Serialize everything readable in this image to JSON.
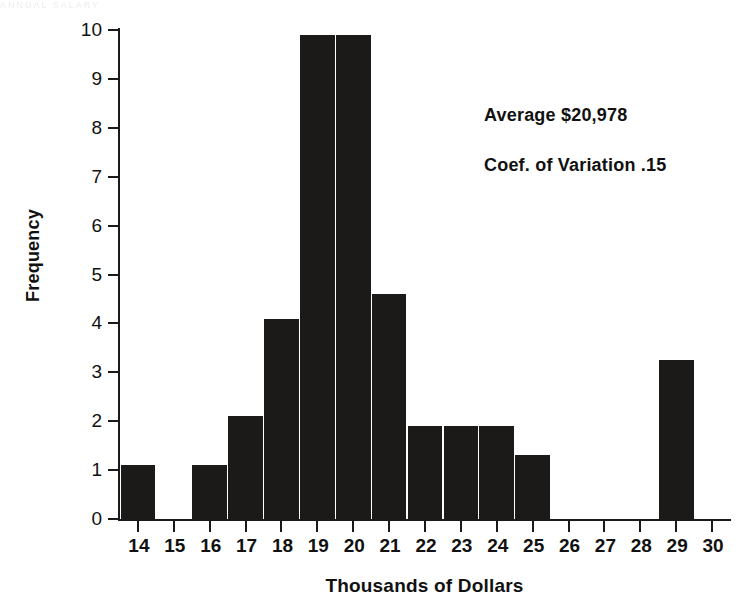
{
  "artifact": {
    "top_strip_text": "ANNUAL SALARY"
  },
  "chart_data": {
    "type": "bar",
    "title": "",
    "xlabel": "Thousands of Dollars",
    "ylabel": "Frequency",
    "categories": [
      "14",
      "15",
      "16",
      "17",
      "18",
      "19",
      "20",
      "21",
      "22",
      "23",
      "24",
      "25",
      "26",
      "27",
      "28",
      "29",
      "30"
    ],
    "values": [
      1.1,
      0,
      1.1,
      2.1,
      4.1,
      9.9,
      9.9,
      4.6,
      1.9,
      1.9,
      1.9,
      1.3,
      0,
      0,
      0,
      3.25,
      0
    ],
    "xlim": [
      13.5,
      30.5
    ],
    "ylim": [
      0,
      10
    ],
    "y_ticks": [
      0,
      1,
      2,
      3,
      4,
      5,
      6,
      7,
      8,
      9,
      10
    ],
    "x_ticks": [
      14,
      15,
      16,
      17,
      18,
      19,
      20,
      21,
      22,
      23,
      24,
      25,
      26,
      27,
      28,
      29,
      30
    ],
    "grid": false,
    "legend": null,
    "bar_color": "#1c1a19",
    "background_color": "#ffffff",
    "annotations": [
      {
        "name": "average",
        "text": "Average $20,978"
      },
      {
        "name": "coefficient-of-variation",
        "text": "Coef. of Variation .15"
      }
    ]
  }
}
